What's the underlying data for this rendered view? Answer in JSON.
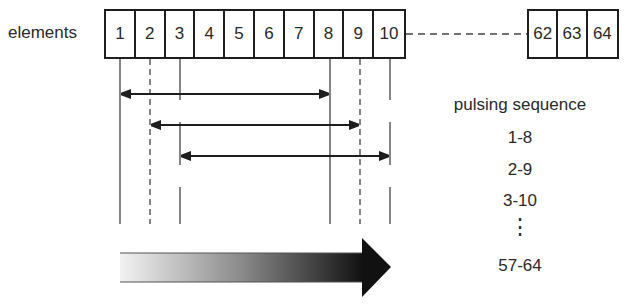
{
  "diagram": {
    "row_label": "elements",
    "elements_first": [
      "1",
      "2",
      "3",
      "4",
      "5",
      "6",
      "7",
      "8",
      "9",
      "10"
    ],
    "elements_last": [
      "62",
      "63",
      "64"
    ],
    "pulsing": {
      "title": "pulsing sequence",
      "items": [
        "1-8",
        "2-9",
        "3-10"
      ],
      "ellipsis": "⋮",
      "last": "57-64"
    },
    "arrows": [
      {
        "from": 1,
        "to": 8
      },
      {
        "from": 2,
        "to": 9
      },
      {
        "from": 3,
        "to": 10
      }
    ],
    "progress_arrow": "gradient-direction-arrow",
    "colors": {
      "line": "#1e1e1e",
      "gradient_start": "#f0f0f0",
      "gradient_end": "#111111"
    }
  }
}
